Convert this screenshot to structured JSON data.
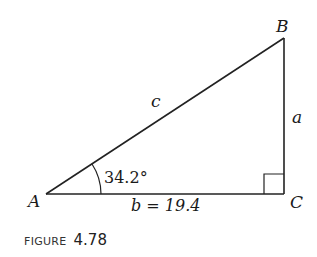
{
  "figure": {
    "caption_word": "FIGURE",
    "caption_number": "4.78",
    "triangle": {
      "vertices": {
        "A": {
          "label": "A"
        },
        "B": {
          "label": "B"
        },
        "C": {
          "label": "C"
        }
      },
      "sides": {
        "hypotenuse": {
          "label": "c"
        },
        "vertical": {
          "label": "a"
        },
        "base": {
          "label": "b = 19.4"
        }
      },
      "angle_A": {
        "label": "34.2°"
      },
      "right_angle_at": "C"
    }
  }
}
